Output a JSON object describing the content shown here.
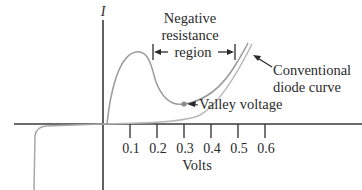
{
  "diagram": {
    "y_axis_label": "I",
    "x_axis_label": "Volts",
    "x_ticks": [
      "0.1",
      "0.2",
      "0.3",
      "0.4",
      "0.5",
      "0.6"
    ],
    "annotations": {
      "negative_resistance": [
        "Negative",
        "resistance",
        "region"
      ],
      "conventional_curve": [
        "Conventional",
        "diode curve"
      ],
      "valley_voltage": "Valley voltage"
    },
    "colors": {
      "axis": "#3a3a3a",
      "tunnel_curve": "#9a9a9a",
      "conventional_curve": "#b5b5b5",
      "text": "#2a2a2a",
      "valley_dot": "#8a8a8a"
    }
  }
}
